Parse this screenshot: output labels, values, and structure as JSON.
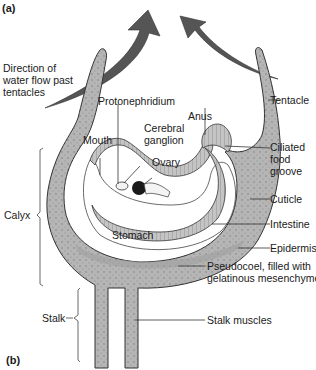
{
  "figure": {
    "panel_a": "(a)",
    "panel_b": "(b)"
  },
  "labels": {
    "direction_line1": "Direction of",
    "direction_line2": "water flow past",
    "direction_line3": "tentacles",
    "protonephridium": "Protonephridium",
    "mouth": "Mouth",
    "cerebral_line1": "Cerebral",
    "cerebral_line2": "ganglion",
    "ovary": "Ovary",
    "anus": "Anus",
    "tentacle": "Tentacle",
    "ciliated_line1": "Ciliated",
    "ciliated_line2": "food",
    "ciliated_line3": "groove",
    "cuticle": "Cuticle",
    "intestine": "Intestine",
    "stomach": "Stomach",
    "epidermis": "Epidermis",
    "pseudocoel_line1": "Pseudocoel, filled with",
    "pseudocoel_line2": "gelatinous mesenchyme",
    "calyx": "Calyx",
    "stalk": "Stalk",
    "stalk_muscles": "Stalk muscles"
  },
  "colors": {
    "tissue": "#b9b9b9",
    "tissue_dark": "#8a8a8a",
    "arrow": "#555555",
    "outline": "#333333",
    "ovary": "#1a1a1a"
  }
}
